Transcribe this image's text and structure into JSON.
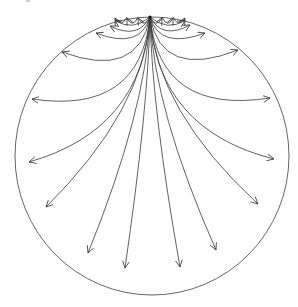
{
  "diagram": {
    "type": "radial-arrow-fan-in-disk",
    "colors": {
      "background": "#ffffff",
      "edge": "#3a3a3a",
      "boundary": "#555555"
    },
    "boundary_circle": {
      "cx": 152,
      "cy": 156,
      "rx": 137,
      "ry": 139
    },
    "source_point": {
      "x": 150,
      "y": 17
    },
    "arrows": [
      {
        "side": "left",
        "tip": [
          115,
          20
        ],
        "ctrl": [
          132,
          32
        ]
      },
      {
        "side": "left",
        "tip": [
          110,
          26
        ],
        "ctrl": [
          138,
          40
        ]
      },
      {
        "side": "left",
        "tip": [
          96,
          33
        ],
        "ctrl": [
          140,
          50
        ]
      },
      {
        "side": "left",
        "tip": [
          62,
          52
        ],
        "ctrl": [
          138,
          80
        ]
      },
      {
        "side": "left",
        "tip": [
          32,
          99
        ],
        "ctrl": [
          140,
          115
        ]
      },
      {
        "side": "left",
        "tip": [
          29,
          162
        ],
        "ctrl": [
          142,
          130
        ]
      },
      {
        "side": "left",
        "tip": [
          46,
          207
        ],
        "ctrl": [
          144,
          110
        ]
      },
      {
        "side": "left",
        "tip": [
          88,
          253
        ],
        "ctrl": [
          146,
          110
        ]
      },
      {
        "side": "left",
        "tip": [
          125,
          268
        ],
        "ctrl": [
          148,
          110
        ]
      },
      {
        "side": "right",
        "tip": [
          185,
          20
        ],
        "ctrl": [
          168,
          32
        ]
      },
      {
        "side": "right",
        "tip": [
          190,
          25
        ],
        "ctrl": [
          162,
          40
        ]
      },
      {
        "side": "right",
        "tip": [
          205,
          33
        ],
        "ctrl": [
          160,
          50
        ]
      },
      {
        "side": "right",
        "tip": [
          238,
          50
        ],
        "ctrl": [
          162,
          80
        ]
      },
      {
        "side": "right",
        "tip": [
          270,
          98
        ],
        "ctrl": [
          160,
          115
        ]
      },
      {
        "side": "right",
        "tip": [
          274,
          159
        ],
        "ctrl": [
          158,
          130
        ]
      },
      {
        "side": "right",
        "tip": [
          258,
          204
        ],
        "ctrl": [
          156,
          110
        ]
      },
      {
        "side": "right",
        "tip": [
          216,
          250
        ],
        "ctrl": [
          154,
          110
        ]
      },
      {
        "side": "right",
        "tip": [
          180,
          267
        ],
        "ctrl": [
          152,
          110
        ]
      }
    ],
    "small_loops": [
      {
        "x1": 150,
        "x2": 138,
        "depth": 6
      },
      {
        "x1": 138,
        "x2": 127,
        "depth": 6
      },
      {
        "x1": 127,
        "x2": 115,
        "depth": 6
      },
      {
        "x1": 150,
        "x2": 162,
        "depth": 6
      },
      {
        "x1": 162,
        "x2": 173,
        "depth": 6
      },
      {
        "x1": 173,
        "x2": 185,
        "depth": 6
      }
    ]
  }
}
